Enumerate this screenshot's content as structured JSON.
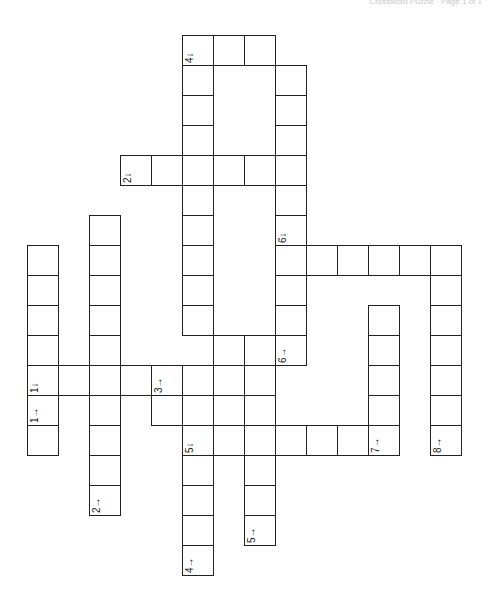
{
  "header": {
    "text": "Crossword Puzzle · Page 1 of 1"
  },
  "puzzle": {
    "cell_size": 31,
    "origin_x": 27,
    "origin_y": 35,
    "cells": [
      [
        5,
        0
      ],
      [
        6,
        0
      ],
      [
        7,
        0
      ],
      [
        5,
        1
      ],
      [
        5,
        2
      ],
      [
        5,
        3
      ],
      [
        3,
        4
      ],
      [
        4,
        4
      ],
      [
        5,
        4
      ],
      [
        6,
        4
      ],
      [
        7,
        4
      ],
      [
        5,
        5
      ],
      [
        5,
        6
      ],
      [
        5,
        7
      ],
      [
        5,
        8
      ],
      [
        5,
        9
      ],
      [
        8,
        1
      ],
      [
        8,
        2
      ],
      [
        8,
        3
      ],
      [
        8,
        4
      ],
      [
        8,
        5
      ],
      [
        8,
        6
      ],
      [
        8,
        7
      ],
      [
        9,
        7
      ],
      [
        10,
        7
      ],
      [
        11,
        7
      ],
      [
        12,
        7
      ],
      [
        13,
        7
      ],
      [
        8,
        8
      ],
      [
        8,
        9
      ],
      [
        8,
        10
      ],
      [
        13,
        8
      ],
      [
        13,
        9
      ],
      [
        13,
        10
      ],
      [
        13,
        11
      ],
      [
        13,
        12
      ],
      [
        13,
        13
      ],
      [
        2,
        6
      ],
      [
        2,
        7
      ],
      [
        2,
        8
      ],
      [
        2,
        9
      ],
      [
        2,
        10
      ],
      [
        2,
        11
      ],
      [
        2,
        12
      ],
      [
        2,
        13
      ],
      [
        2,
        14
      ],
      [
        2,
        15
      ],
      [
        0,
        7
      ],
      [
        0,
        8
      ],
      [
        0,
        9
      ],
      [
        0,
        10
      ],
      [
        0,
        11
      ],
      [
        0,
        12
      ],
      [
        0,
        13
      ],
      [
        1,
        11
      ],
      [
        3,
        11
      ],
      [
        4,
        11
      ],
      [
        6,
        10
      ],
      [
        7,
        10
      ],
      [
        6,
        11
      ],
      [
        7,
        11
      ],
      [
        4,
        12
      ],
      [
        7,
        12
      ],
      [
        5,
        11
      ],
      [
        5,
        12
      ],
      [
        6,
        12
      ],
      [
        6,
        13
      ],
      [
        7,
        13
      ],
      [
        8,
        13
      ],
      [
        9,
        13
      ],
      [
        10,
        13
      ],
      [
        11,
        13
      ],
      [
        11,
        9
      ],
      [
        11,
        10
      ],
      [
        11,
        11
      ],
      [
        11,
        12
      ],
      [
        7,
        14
      ],
      [
        7,
        15
      ],
      [
        7,
        16
      ],
      [
        5,
        13
      ],
      [
        5,
        14
      ],
      [
        5,
        15
      ],
      [
        5,
        16
      ],
      [
        5,
        17
      ]
    ],
    "labels": [
      {
        "col": 5,
        "row": 0,
        "text": "4↓"
      },
      {
        "col": 3,
        "row": 4,
        "text": "2↓"
      },
      {
        "col": 8,
        "row": 6,
        "text": "6↓"
      },
      {
        "col": 0,
        "row": 11,
        "text": "1↓"
      },
      {
        "col": 0,
        "row": 12,
        "text": "1→"
      },
      {
        "col": 4,
        "row": 10,
        "text": "3↓"
      },
      {
        "col": 4,
        "row": 11,
        "text": "3→"
      },
      {
        "col": 8,
        "row": 10,
        "text": "6→"
      },
      {
        "col": 5,
        "row": 13,
        "text": "5↓"
      },
      {
        "col": 11,
        "row": 13,
        "text": "7→"
      },
      {
        "col": 13,
        "row": 13,
        "text": "8→"
      },
      {
        "col": 2,
        "row": 15,
        "text": "2→"
      },
      {
        "col": 7,
        "row": 16,
        "text": "5→"
      },
      {
        "col": 5,
        "row": 17,
        "text": "4→"
      }
    ]
  }
}
